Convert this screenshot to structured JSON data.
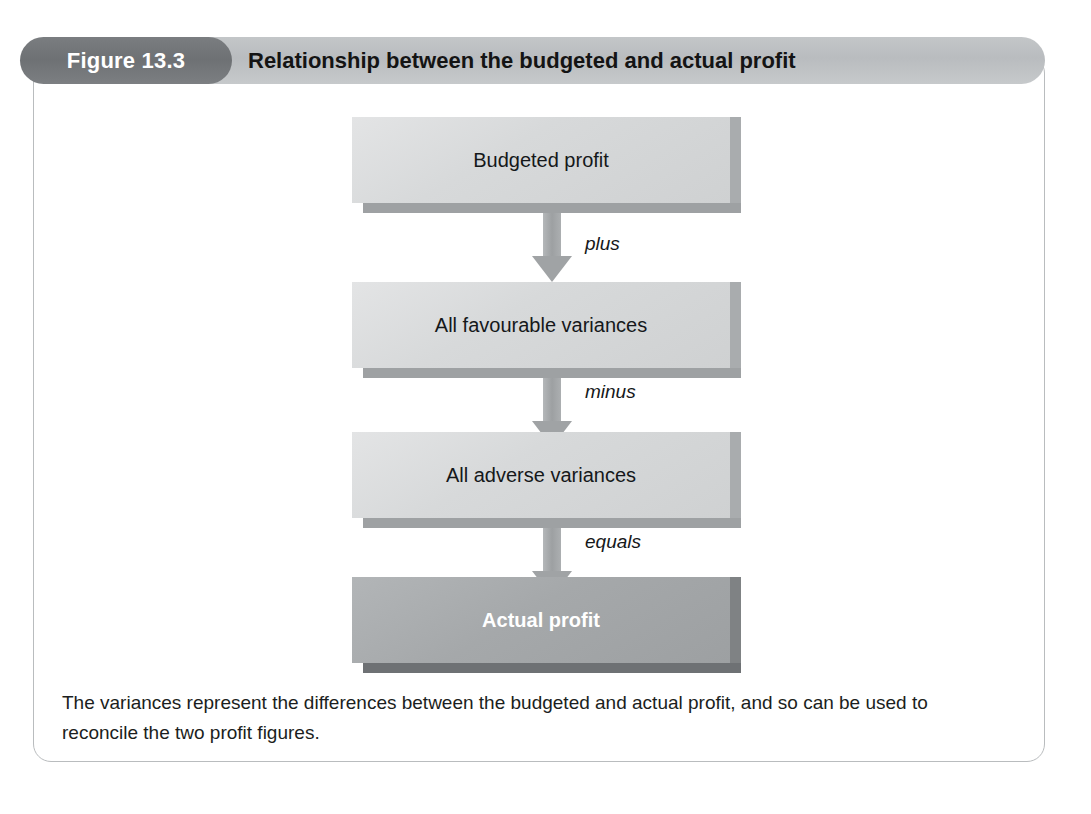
{
  "figure": {
    "number_label": "Figure 13.3",
    "title": "Relationship between the budgeted and actual profit",
    "caption": "The variances represent the differences between the budgeted and actual profit, and so can be used to reconcile the two profit figures."
  },
  "colors": {
    "header_band": "#bcbfc1",
    "number_pill": "#727578",
    "frame_border": "#b9bcbe",
    "node_light_face": "#d7d9da",
    "node_dark_face": "#a5a8aa",
    "arrow": "#a0a3a5",
    "text_dark": "#15181a",
    "text_light": "#ffffff"
  },
  "diagram": {
    "type": "flowchart",
    "orientation": "vertical",
    "nodes": [
      {
        "id": "budgeted-profit",
        "label": "Budgeted profit",
        "style": "light",
        "emphasis": false
      },
      {
        "id": "favourable-variances",
        "label": "All favourable variances",
        "style": "light",
        "emphasis": false
      },
      {
        "id": "adverse-variances",
        "label": "All adverse variances",
        "style": "light",
        "emphasis": false
      },
      {
        "id": "actual-profit",
        "label": "Actual profit",
        "style": "dark",
        "emphasis": true
      }
    ],
    "connectors": [
      {
        "id": "connector-plus",
        "label": "plus",
        "from": "budgeted-profit",
        "to": "favourable-variances"
      },
      {
        "id": "connector-minus",
        "label": "minus",
        "from": "favourable-variances",
        "to": "adverse-variances"
      },
      {
        "id": "connector-equals",
        "label": "equals",
        "from": "adverse-variances",
        "to": "actual-profit"
      }
    ]
  }
}
